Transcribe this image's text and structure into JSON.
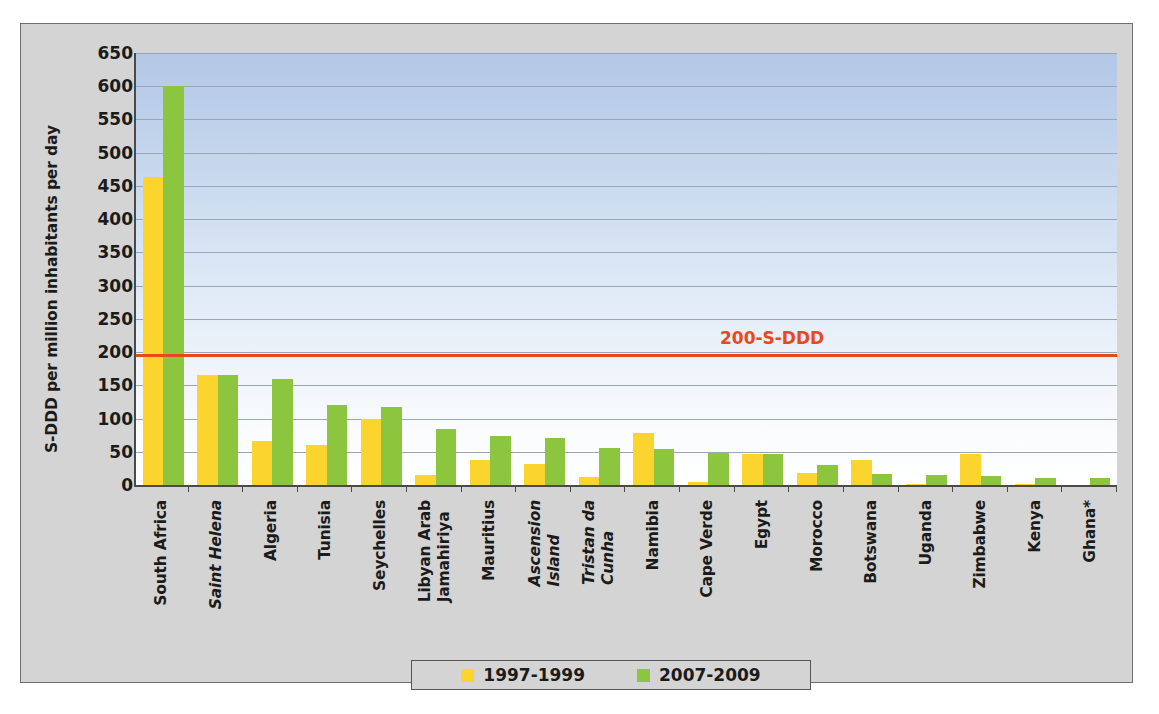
{
  "chart_data": {
    "type": "bar",
    "title": "",
    "xlabel": "",
    "ylabel": "S-DDD per million  inhabitants per day",
    "ylim": [
      0,
      650
    ],
    "ytick_step": 50,
    "yticks": [
      650,
      600,
      550,
      500,
      450,
      400,
      350,
      300,
      250,
      200,
      150,
      100,
      50,
      0
    ],
    "grid": true,
    "legend_position": "bottom",
    "categories": [
      "South Africa",
      "Saint Helena",
      "Algeria",
      "Tunisia",
      "Seychelles",
      "Libyan Arab Jamahiriya",
      "Mauritius",
      "Ascension Island",
      "Tristan da Cunha",
      "Namibia",
      "Cape Verde",
      "Egypt",
      "Morocco",
      "Botswana",
      "Uganda",
      "Zimbabwe",
      "Kenya",
      "Ghana*"
    ],
    "category_lines": [
      [
        "South Africa"
      ],
      [
        "Saint Helena"
      ],
      [
        "Algeria"
      ],
      [
        "Tunisia"
      ],
      [
        "Seychelles"
      ],
      [
        "Libyan Arab",
        "Jamahiriya"
      ],
      [
        "Mauritius"
      ],
      [
        "Ascension",
        "Island"
      ],
      [
        "Tristan da",
        "Cunha"
      ],
      [
        "Namibia"
      ],
      [
        "Cape Verde"
      ],
      [
        "Egypt"
      ],
      [
        "Morocco"
      ],
      [
        "Botswana"
      ],
      [
        "Uganda"
      ],
      [
        "Zimbabwe"
      ],
      [
        "Kenya"
      ],
      [
        "Ghana*"
      ]
    ],
    "category_italic": [
      false,
      true,
      false,
      false,
      false,
      false,
      false,
      true,
      true,
      false,
      false,
      false,
      false,
      false,
      false,
      false,
      false,
      false
    ],
    "series": [
      {
        "name": "1997-1999",
        "color": "#fbd42e",
        "values": [
          463,
          166,
          66,
          60,
          100,
          15,
          38,
          31,
          12,
          78,
          5,
          47,
          18,
          38,
          1,
          47,
          2,
          0
        ]
      },
      {
        "name": "2007-2009",
        "color": "#8cc63e",
        "values": [
          600,
          166,
          160,
          121,
          118,
          85,
          73,
          71,
          56,
          54,
          48,
          47,
          30,
          17,
          15,
          13,
          11,
          10
        ]
      }
    ],
    "annotations": [
      {
        "name": "threshold",
        "label": "200-S-DDD",
        "value": 197,
        "color": "#e8491b"
      }
    ]
  },
  "legend": {
    "entries": [
      {
        "label": "1997-1999",
        "color": "#fbd42e"
      },
      {
        "label": "2007-2009",
        "color": "#8cc63e"
      }
    ]
  }
}
